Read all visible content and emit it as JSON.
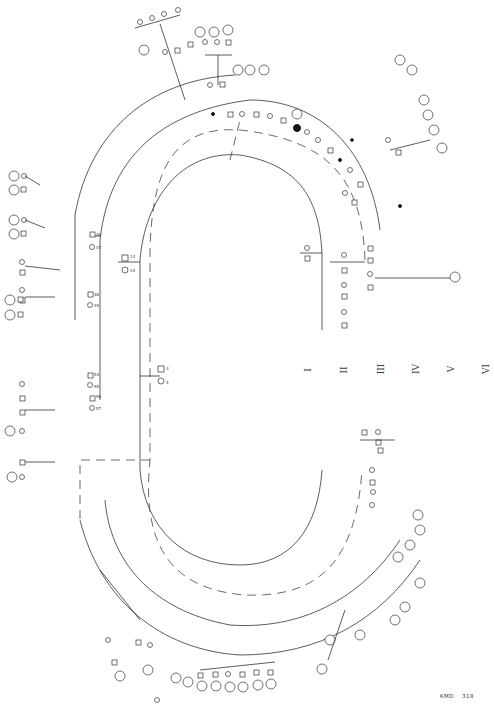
{
  "figure": {
    "type": "pedigree-chart",
    "orientation": "rotated-90",
    "generation_labels": [
      "I",
      "II",
      "III",
      "IV",
      "V",
      "VI"
    ],
    "footer": {
      "code": "KMD",
      "number": "318"
    }
  },
  "legible_ids": {
    "founders": [
      "1",
      "2",
      "3",
      "4"
    ],
    "left_branch": [
      "13",
      "14",
      "46",
      "47",
      "48",
      "49",
      "54",
      "55",
      "56",
      "57"
    ],
    "left_outer": [
      "107",
      "108",
      "109",
      "110",
      "111",
      "112",
      "113",
      "116",
      "117",
      "118",
      "119",
      "120",
      "121",
      "122",
      "180",
      "181",
      "182",
      "183",
      "184",
      "185",
      "186",
      "187",
      "188",
      "189",
      "190",
      "191",
      "192",
      "193",
      "194",
      "195"
    ],
    "right_branch": [
      "5",
      "6",
      "7",
      "8",
      "9",
      "10"
    ],
    "bottom_circled": [
      "94",
      "73",
      "93",
      "100",
      "101",
      "92",
      "97",
      "99"
    ]
  },
  "colors": {
    "ink": "#333333",
    "paper": "#ffffff",
    "affected": "#111111"
  }
}
